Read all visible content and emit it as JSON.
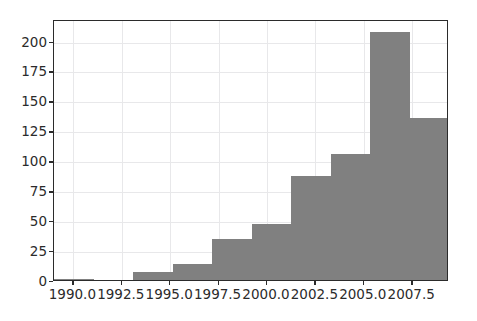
{
  "chart_data": {
    "type": "bar",
    "title": "",
    "subtitle": "",
    "xlabel": "",
    "ylabel": "",
    "grid": true,
    "legend": false,
    "legend_position": "none",
    "bar_color": "#808080",
    "grid_color": "#e8e8ea",
    "axis_color": "#2b2b2b",
    "background_color": "#ffffff",
    "xlim": [
      1989.0,
      2009.4
    ],
    "ylim": [
      0,
      218
    ],
    "xtick_labels": [
      "1990.0",
      "1992.5",
      "1995.0",
      "1997.5",
      "2000.0",
      "2002.5",
      "2005.0",
      "2007.5"
    ],
    "xtick_values": [
      1990.0,
      1992.5,
      1995.0,
      1997.5,
      2000.0,
      2002.5,
      2005.0,
      2007.5
    ],
    "ytick_labels": [
      "0",
      "25",
      "50",
      "75",
      "100",
      "125",
      "150",
      "175",
      "200"
    ],
    "ytick_values": [
      0,
      25,
      50,
      75,
      100,
      125,
      150,
      175,
      200
    ],
    "bin_edges": [
      1989.0,
      1991.04,
      1993.08,
      1995.12,
      1997.16,
      1999.2,
      2001.24,
      2003.28,
      2005.32,
      2007.36,
      2009.4
    ],
    "categories": [
      "1989.0-1991.0",
      "1991.0-1993.1",
      "1993.1-1995.1",
      "1995.1-1997.2",
      "1997.2-1999.2",
      "1999.2-2001.2",
      "2001.2-2003.3",
      "2003.3-2005.3",
      "2005.3-2007.4",
      "2007.4-2009.4"
    ],
    "values": [
      1,
      0,
      7,
      13,
      34,
      47,
      87,
      105,
      207,
      135
    ]
  }
}
